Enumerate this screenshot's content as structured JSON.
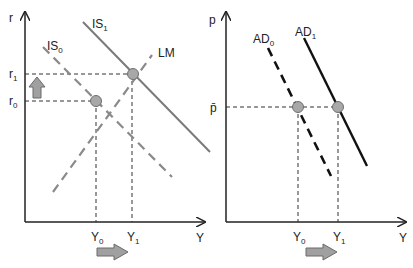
{
  "left_panel": {
    "title": "IS-LM",
    "y_axis_label": "r",
    "x_axis_label": "Y",
    "r_labels": [
      {
        "base": "r",
        "sub": "1"
      },
      {
        "base": "r",
        "sub": "0"
      }
    ],
    "y_labels": [
      {
        "base": "Y",
        "sub": "0"
      },
      {
        "base": "Y",
        "sub": "1"
      }
    ],
    "curves": [
      {
        "base": "IS",
        "sub": "0",
        "style": "dashed",
        "color": "#8a8a8a"
      },
      {
        "base": "IS",
        "sub": "1",
        "style": "solid",
        "color": "#7a7a7a"
      },
      {
        "label": "LM",
        "style": "dashed",
        "color": "#8a8a8a"
      }
    ],
    "arrow_up": "up-arrow",
    "arrow_right": "right-arrow"
  },
  "right_panel": {
    "title": "AD",
    "y_axis_label": "p",
    "x_axis_label": "Y",
    "p_label": "p̄",
    "y_labels": [
      {
        "base": "Y",
        "sub": "0"
      },
      {
        "base": "Y",
        "sub": "1"
      }
    ],
    "curves": [
      {
        "base": "AD",
        "sub": "0",
        "style": "dashed",
        "color": "#111111"
      },
      {
        "base": "AD",
        "sub": "1",
        "style": "solid",
        "color": "#111111"
      }
    ],
    "arrow_right": "right-arrow"
  },
  "colors": {
    "axis": "#222222",
    "point_fill": "#a8a8a8",
    "point_stroke": "#6f6f6f",
    "arrow_fill": "#a0a0a0",
    "arrow_stroke": "#6a6a6a"
  }
}
